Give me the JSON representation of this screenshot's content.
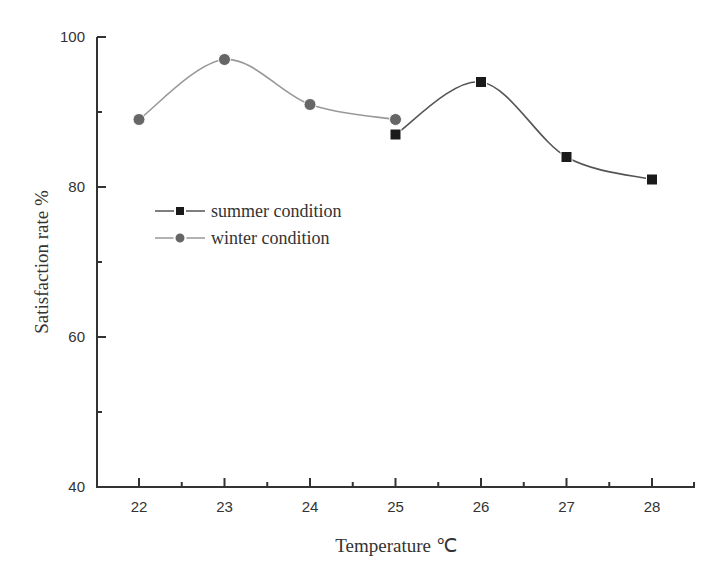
{
  "chart_data": {
    "type": "line",
    "title": "",
    "xlabel": "Temperature ℃",
    "ylabel": "Satisfaction rate %",
    "xlim": [
      21.5,
      28.5
    ],
    "ylim": [
      40,
      100
    ],
    "x_ticks": [
      22,
      23,
      24,
      25,
      26,
      27,
      28
    ],
    "x_tick_labels": [
      "22",
      "23",
      "24",
      "25",
      "26",
      "27",
      "28"
    ],
    "y_ticks": [
      40,
      60,
      80,
      100
    ],
    "y_tick_labels": [
      "40",
      "60",
      "80",
      "100"
    ],
    "y_minor_ticks": [
      50,
      70,
      90
    ],
    "x_minor_ticks": [
      22.5,
      23.5,
      24.5,
      25.5,
      26.5,
      27.5
    ],
    "grid": false,
    "smooth": true,
    "legend_position": "center-left",
    "series": [
      {
        "name": "summer condition",
        "marker": "square",
        "color": "#1a1a1a",
        "line_color": "#555555",
        "x": [
          25,
          26,
          27,
          28
        ],
        "values": [
          87,
          94,
          84,
          81
        ]
      },
      {
        "name": "winter condition",
        "marker": "circle",
        "color": "#666666",
        "line_color": "#999999",
        "x": [
          22,
          23,
          24,
          25
        ],
        "values": [
          89,
          97,
          91,
          89
        ]
      }
    ]
  }
}
